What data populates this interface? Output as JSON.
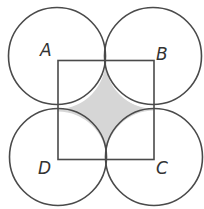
{
  "figure": {
    "labels": {
      "A": "A",
      "B": "B",
      "C": "C",
      "D": "D"
    },
    "colors": {
      "stroke": "#4a4a4a",
      "shade": "#d6d6d6",
      "background": "#ffffff"
    },
    "square": {
      "corners": {
        "A": [
          58,
          61
        ],
        "B": [
          153,
          60
        ],
        "C": [
          154,
          159
        ],
        "D": [
          58,
          160
        ]
      }
    },
    "circle_radius": 48.5,
    "shaded_region": "region inside square outside all four circles"
  }
}
